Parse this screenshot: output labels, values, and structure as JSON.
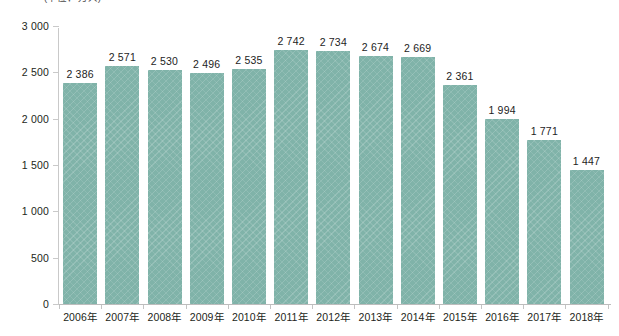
{
  "chart_data": {
    "type": "bar",
    "title": "",
    "subtitle": "",
    "unit_caption": "(单位：万人)",
    "xlabel": "",
    "ylabel": "",
    "categories": [
      "2006年",
      "2007年",
      "2008年",
      "2009年",
      "2010年",
      "2011年",
      "2012年",
      "2013年",
      "2014年",
      "2015年",
      "2016年",
      "2017年",
      "2018年"
    ],
    "values": [
      2386,
      2571,
      2530,
      2496,
      2535,
      2742,
      2734,
      2674,
      2669,
      2361,
      1994,
      1771,
      1447
    ],
    "value_labels": [
      "2 386",
      "2 571",
      "2 530",
      "2 496",
      "2 535",
      "2 742",
      "2 734",
      "2 674",
      "2 669",
      "2 361",
      "1 994",
      "1 771",
      "1 447"
    ],
    "ylim": [
      0,
      3000
    ],
    "ytick_values": [
      0,
      500,
      1000,
      1500,
      2000,
      2500,
      3000
    ],
    "ytick_labels": [
      "0",
      "500",
      "1 000",
      "1 500",
      "2 000",
      "2 500",
      "3 000"
    ],
    "grid": false,
    "legend": null,
    "series": [
      {
        "name": "",
        "values": [
          2386,
          2571,
          2530,
          2496,
          2535,
          2742,
          2734,
          2674,
          2669,
          2361,
          1994,
          1771,
          1447
        ]
      }
    ],
    "colors": {
      "bar_fill": "#80b3a9",
      "axis_line": "#c4c4c4",
      "text": "#231f20"
    }
  }
}
